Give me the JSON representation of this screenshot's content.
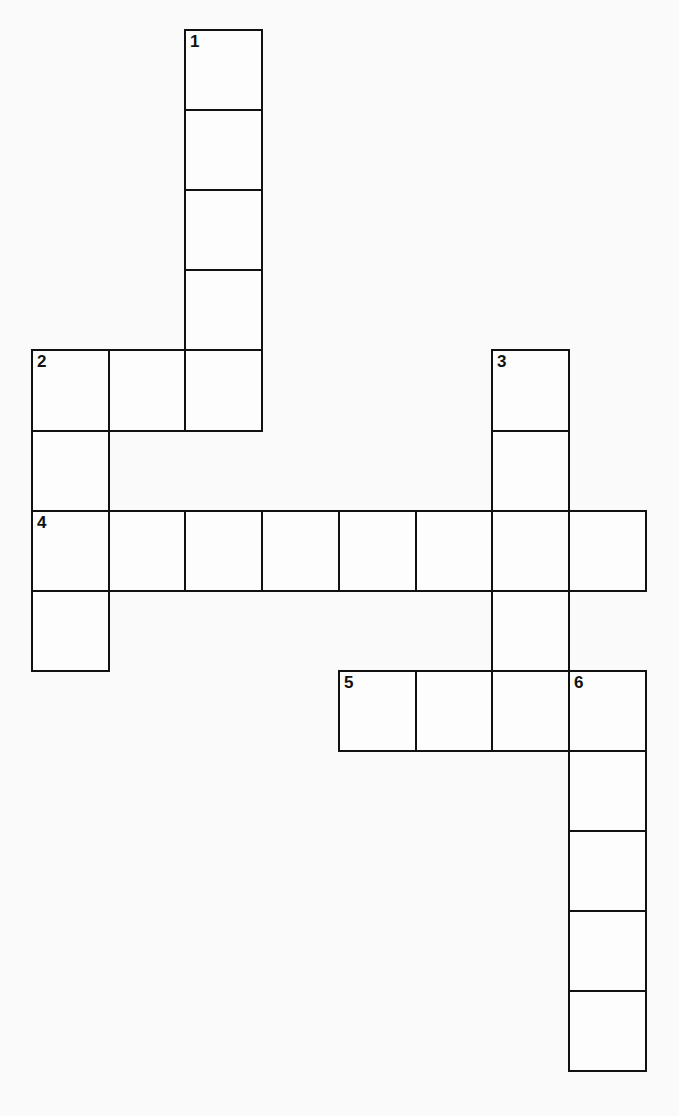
{
  "puzzle": {
    "type": "crossword",
    "grid": {
      "origin_x": 32,
      "origin_y": 30,
      "cell_w": 76.7,
      "cell_h": 80.1,
      "cols": 8,
      "rows": 13
    },
    "colors": {
      "background": "#fafafa",
      "line": "#111111"
    },
    "entries": [
      {
        "number": "1",
        "direction": "down",
        "col": 2,
        "row": 0,
        "length": 5
      },
      {
        "number": "2",
        "direction": "down",
        "col": 0,
        "row": 4,
        "length": 4
      },
      {
        "number": "3",
        "direction": "down",
        "col": 6,
        "row": 4,
        "length": 5
      },
      {
        "number": "4",
        "direction": "across",
        "col": 0,
        "row": 6,
        "length": 8
      },
      {
        "number": "5",
        "direction": "across",
        "col": 4,
        "row": 8,
        "length": 4
      },
      {
        "number": "6",
        "direction": "down",
        "col": 7,
        "row": 8,
        "length": 5
      }
    ],
    "extra_cells": [
      {
        "col": 1,
        "row": 4
      }
    ]
  }
}
